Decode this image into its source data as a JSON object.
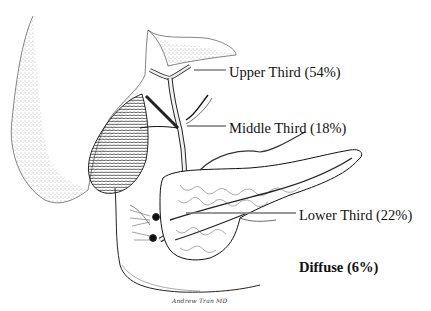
{
  "figure": {
    "type": "anatomical illustration",
    "colors": {
      "ink": "#111111",
      "leader_line": "#777777",
      "background": "#ffffff"
    }
  },
  "labels": {
    "upper": "Upper Third (54%)",
    "middle": "Middle Third (18%)",
    "lower": "Lower Third (22%)",
    "diffuse": "Diffuse (6%)"
  },
  "distribution": [
    {
      "region": "Upper Third",
      "percent": 54
    },
    {
      "region": "Middle Third",
      "percent": 18
    },
    {
      "region": "Lower Third",
      "percent": 22
    },
    {
      "region": "Diffuse",
      "percent": 6
    }
  ],
  "signature": "Andrew Tran MD"
}
